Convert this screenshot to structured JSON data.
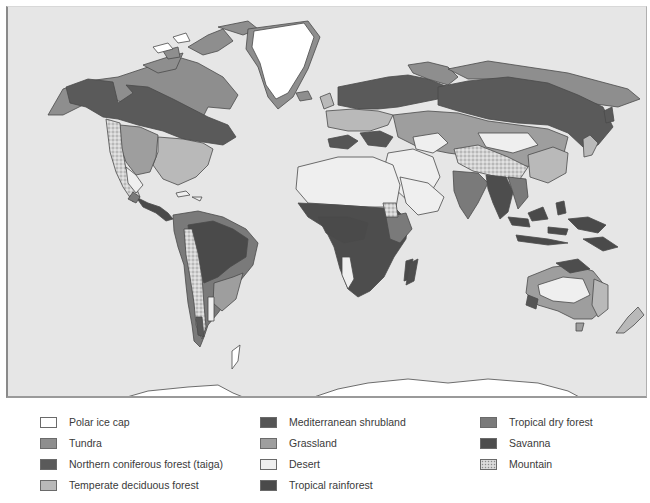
{
  "map": {
    "ocean_color": "#e6e6e6",
    "outline_color": "#4a4a4a",
    "biome_colors": {
      "polar_ice_cap": "#ffffff",
      "tundra": "#8e8e8e",
      "taiga": "#5a5a5a",
      "temperate_deciduous_forest": "#b9b9b9",
      "mediterranean_shrubland": "#555555",
      "grassland": "#9e9e9e",
      "desert": "#efefef",
      "tropical_rainforest": "#4a4a4a",
      "tropical_dry_forest": "#7a7a7a",
      "savanna": "#4d4d4d",
      "mountain": "#cfcfcf"
    }
  },
  "legend": {
    "columns": [
      {
        "items": [
          {
            "key": "polar_ice_cap",
            "label": "Polar ice cap",
            "color": "#ffffff"
          },
          {
            "key": "tundra",
            "label": "Tundra",
            "color": "#8e8e8e"
          },
          {
            "key": "taiga",
            "label": "Northern coniferous forest (taiga)",
            "color": "#5a5a5a"
          },
          {
            "key": "temperate_deciduous_forest",
            "label": "Temperate deciduous forest",
            "color": "#b9b9b9"
          }
        ]
      },
      {
        "items": [
          {
            "key": "mediterranean_shrubland",
            "label": "Mediterranean shrubland",
            "color": "#555555"
          },
          {
            "key": "grassland",
            "label": "Grassland",
            "color": "#9e9e9e"
          },
          {
            "key": "desert",
            "label": "Desert",
            "color": "#efefef"
          },
          {
            "key": "tropical_rainforest",
            "label": "Tropical rainforest",
            "color": "#4a4a4a"
          }
        ]
      },
      {
        "items": [
          {
            "key": "tropical_dry_forest",
            "label": "Tropical dry forest",
            "color": "#7a7a7a"
          },
          {
            "key": "savanna",
            "label": "Savanna",
            "color": "#4d4d4d"
          },
          {
            "key": "mountain",
            "label": "Mountain",
            "color": "#cfcfcf"
          }
        ]
      }
    ]
  }
}
